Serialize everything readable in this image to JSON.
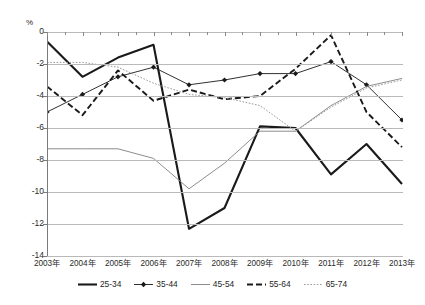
{
  "chart_data": {
    "type": "line",
    "title": "",
    "xlabel": "",
    "ylabel": "%",
    "unit_label": "%",
    "categories": [
      "2003年",
      "2004年",
      "2005年",
      "2006年",
      "2007年",
      "2008年",
      "2009年",
      "2010年",
      "2011年",
      "2012年",
      "2013年"
    ],
    "ylim": [
      -14,
      0
    ],
    "ytick_labels": [
      "0",
      "-2",
      "-4",
      "-6",
      "-8",
      "-10",
      "-12",
      "-14"
    ],
    "ytick_values": [
      0,
      -2,
      -4,
      -6,
      -8,
      -10,
      -12,
      -14
    ],
    "grid": true,
    "legend_position": "bottom",
    "series": [
      {
        "name": "25-34",
        "style": "solid-thick",
        "color": "#1a1a1a",
        "marker": "none",
        "values": [
          -0.6,
          -2.8,
          -1.6,
          -0.8,
          -12.3,
          -11.0,
          -5.9,
          -6.0,
          -8.9,
          -7.0,
          -9.5
        ]
      },
      {
        "name": "35-44",
        "style": "solid-thin-marker",
        "color": "#1a1a1a",
        "marker": "diamond",
        "values": [
          -5.0,
          -3.9,
          -2.8,
          -2.2,
          -3.3,
          -3.0,
          -2.6,
          -2.6,
          -1.85,
          -3.3,
          -5.5
        ]
      },
      {
        "name": "45-54",
        "style": "solid-thin",
        "color": "#808080",
        "marker": "none",
        "values": [
          -7.3,
          -7.3,
          -7.3,
          -7.9,
          -9.8,
          -8.2,
          -6.2,
          -6.2,
          -4.6,
          -3.4,
          -2.9
        ]
      },
      {
        "name": "55-64",
        "style": "dashed-bold",
        "color": "#1a1a1a",
        "marker": "none",
        "values": [
          -3.4,
          -5.2,
          -2.4,
          -4.3,
          -3.6,
          -4.2,
          -4.0,
          -2.3,
          -0.2,
          -5.0,
          -7.2
        ]
      },
      {
        "name": "65-74",
        "style": "dotted",
        "color": "#9a9a9a",
        "marker": "none",
        "values": [
          -1.9,
          -1.9,
          -2.2,
          -3.2,
          -3.9,
          -4.1,
          -4.6,
          -6.2,
          -4.7,
          -3.5,
          -3.0
        ]
      }
    ]
  },
  "legend": {
    "items": [
      {
        "label": "25-34"
      },
      {
        "label": "35-44"
      },
      {
        "label": "45-54"
      },
      {
        "label": "55-64"
      },
      {
        "label": "65-74"
      }
    ]
  },
  "footnote": {
    "text": ""
  }
}
